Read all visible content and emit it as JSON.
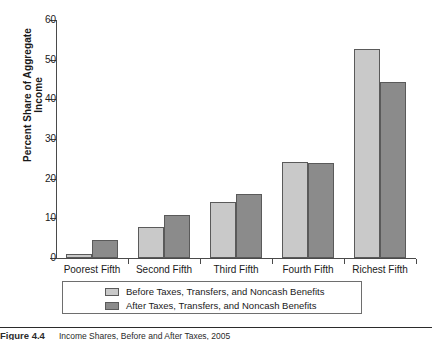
{
  "chart_data": {
    "type": "bar",
    "title": "",
    "xlabel": "",
    "ylabel": "Percent Share of Aggregate Income",
    "ylim": [
      0,
      60
    ],
    "yticks": [
      0,
      10,
      20,
      30,
      40,
      50,
      60
    ],
    "grid": false,
    "legend_position": "bottom",
    "categories": [
      "Poorest Fifth",
      "Second Fifth",
      "Third Fifth",
      "Fourth Fifth",
      "Richest Fifth"
    ],
    "series": [
      {
        "name": "Before Taxes, Transfers, and Noncash Benefits",
        "color": "#c9c9c9",
        "values": [
          1.0,
          7.8,
          14.2,
          24.2,
          52.8
        ]
      },
      {
        "name": "After Taxes, Transfers, and Noncash Benefits",
        "color": "#8b8b8b",
        "values": [
          4.5,
          10.8,
          16.2,
          23.9,
          44.3
        ]
      }
    ]
  },
  "legend": {
    "items": [
      {
        "label": "Before Taxes, Transfers, and Noncash Benefits",
        "swatch": "before"
      },
      {
        "label": "After Taxes, Transfers, and Noncash Benefits",
        "swatch": "after"
      }
    ]
  },
  "caption": {
    "number": "Figure 4.4",
    "title": "Income Shares, Before and After Taxes, 2005"
  },
  "colors": {
    "before_bar": "#c9c9c9",
    "after_bar": "#8b8b8b",
    "bar_outline": "#5a5a5a",
    "axis": "#4a4a4a",
    "text": "#1a1a1a",
    "legend_border": "#6e6e6e",
    "caption_rule": "#2b2b2b"
  }
}
